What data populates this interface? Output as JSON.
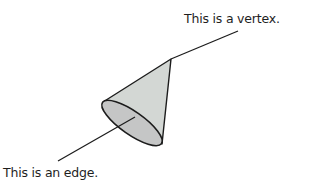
{
  "diagram": {
    "title": "",
    "labels": {
      "vertex": "This is a vertex.",
      "edge": "This is an edge."
    },
    "shapes": {
      "cone": {
        "apex": [
          171,
          59
        ],
        "base_ellipse": {
          "cx": 132,
          "cy": 124,
          "rx": 36,
          "ry": 12,
          "rotate": 34
        },
        "side_color": "#d3d7d4",
        "base_color": "#c5c6c6",
        "stroke_color": "#1c1c1c"
      },
      "vertex_pointer_line": {
        "from": [
          171,
          59
        ],
        "to": [
          238,
          31
        ]
      },
      "edge_pointer_line": {
        "from": [
          135,
          117
        ],
        "to": [
          58,
          161
        ]
      }
    },
    "colors": {
      "background": "#ffffff",
      "text": "#1e1e1e",
      "line": "#1c1c1c"
    }
  }
}
